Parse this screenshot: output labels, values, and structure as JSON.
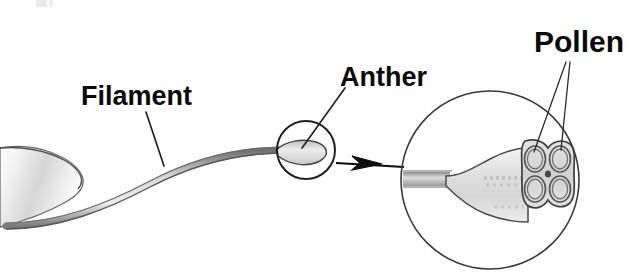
{
  "diagram": {
    "background_color": "#ffffff",
    "labels": {
      "filament": "Filament",
      "anther": "Anther",
      "pollen": "Pollen"
    },
    "colors": {
      "label_text": "#0a0a0a",
      "leader_line": "#242424",
      "circle_stroke": "#3a3a3a",
      "organ_fill_light": "#e8e8e8",
      "organ_fill_mid": "#cfcfcf",
      "organ_outline": "#5a5a5a",
      "arrow": "#0d0d0d"
    },
    "parts": [
      {
        "name": "filament",
        "label": "Filament",
        "description": "Slender curved stalk of the stamen"
      },
      {
        "name": "anther",
        "label": "Anther",
        "description": "Pollen-bearing tip of the stamen, circled for magnification"
      },
      {
        "name": "pollen",
        "label": "Pollen",
        "description": "Grains held in the four pollen sacs of the anther"
      }
    ],
    "pollen_sac_count": 4,
    "magnifier": {
      "center_x": 490,
      "center_y": 180,
      "radius": 89
    },
    "callout_circle": {
      "center_x": 306,
      "center_y": 150,
      "radius": 29
    }
  }
}
